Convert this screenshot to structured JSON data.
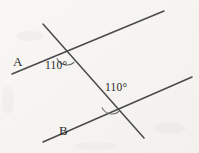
{
  "figure": {
    "type": "geometry-diagram",
    "background_color": "#f6f5f3",
    "ink_color": "#4a4a4a",
    "text_color": "#2a2a2a",
    "width": 199,
    "height": 153
  },
  "labels": {
    "line_a": "A",
    "line_b": "B",
    "angle_1": "110°",
    "angle_2": "110°"
  },
  "geometry": {
    "lines": [
      {
        "name": "line-a",
        "label": "A",
        "x1": 12,
        "y1": 74,
        "x2": 164,
        "y2": 11
      },
      {
        "name": "line-b",
        "label": "B",
        "x1": 43,
        "y1": 142,
        "x2": 192,
        "y2": 77
      },
      {
        "name": "transversal",
        "label": "",
        "x1": 43,
        "y1": 24,
        "x2": 144,
        "y2": 138
      }
    ],
    "intersections": [
      {
        "name": "intersection-top",
        "x": 67,
        "y": 54,
        "angle": "110°"
      },
      {
        "name": "intersection-bottom",
        "x": 112,
        "y": 103,
        "angle": "110°"
      }
    ],
    "arcs": [
      {
        "name": "angle-arc-top",
        "cx": 67,
        "cy": 54,
        "r": 11
      },
      {
        "name": "angle-arc-bottom",
        "cx": 112,
        "cy": 103,
        "r": 11
      }
    ]
  }
}
